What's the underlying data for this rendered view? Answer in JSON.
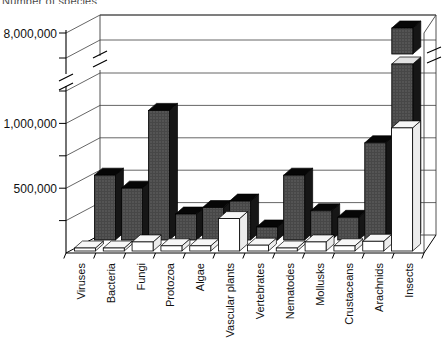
{
  "figure": {
    "cropped_top_text": "Number of species",
    "background_color": "#ffffff",
    "ink_color": "#000000"
  },
  "chart_data": {
    "type": "bar",
    "variant": "3d-columns, two depth rows (white front row, dark back row), broken y-axis",
    "title": "",
    "categories": [
      "Viruses",
      "Bacteria",
      "Fungi",
      "Protozoa",
      "Algae",
      "Vascular plants",
      "Vertebrates",
      "Nematodes",
      "Mollusks",
      "Crustaceans",
      "Arachnids",
      "Insects"
    ],
    "series": [
      {
        "name": "white-front-row",
        "color": "#ffffff",
        "values": [
          5000,
          4000,
          70000,
          40000,
          40000,
          250000,
          45000,
          15000,
          70000,
          40000,
          75000,
          950000
        ]
      },
      {
        "name": "dark-back-row",
        "color": "#474747",
        "values": [
          500000,
          400000,
          1000000,
          200000,
          250000,
          300000,
          100000,
          500000,
          225000,
          175000,
          750000,
          8000000
        ]
      }
    ],
    "y_axis": {
      "labeled_ticks": [
        {
          "value": 500000,
          "label": "500,000"
        },
        {
          "value": 1000000,
          "label": "1,000,000"
        },
        {
          "value": 8000000,
          "label": "8,000,000"
        }
      ],
      "unlabeled_tick_values": [
        250000,
        750000,
        1250000,
        7000000
      ],
      "axis_break": {
        "between": [
          1250000,
          7000000
        ]
      },
      "broken_bar_category": "Insects",
      "gridlines": true,
      "legend": "none"
    },
    "x_axis": {
      "label_rotation_degrees": 90
    }
  }
}
